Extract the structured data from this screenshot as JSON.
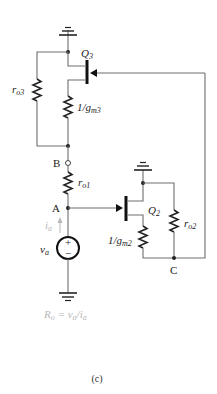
{
  "figure": {
    "caption": "(c)",
    "colors": {
      "wire": "#6e6e6e",
      "component": "#222222",
      "annotation": "#b8b8b8"
    }
  },
  "components": {
    "q3": {
      "label": "Q",
      "sub": "3"
    },
    "q2": {
      "label": "Q",
      "sub": "2"
    },
    "ro3": {
      "label": "r",
      "sub": "o3"
    },
    "gm3": {
      "label": "1/g",
      "sub": "m3"
    },
    "ro1": {
      "label": "r",
      "sub": "o1"
    },
    "gm2": {
      "label": "1/g",
      "sub": "m2"
    },
    "ro2": {
      "label": "r",
      "sub": "o2"
    },
    "source": {
      "label": "v",
      "sub": "a",
      "plus": "+",
      "minus": "−"
    }
  },
  "nodes": {
    "a": "A",
    "b": "B",
    "c": "C"
  },
  "annotations": {
    "current": {
      "label": "i",
      "sub": "a"
    },
    "formula": {
      "lhs": "R",
      "lhs_sub": "o",
      "eq": " = ",
      "num": "v",
      "num_sub": "a",
      "slash": "/",
      "den": "i",
      "den_sub": "a"
    }
  }
}
